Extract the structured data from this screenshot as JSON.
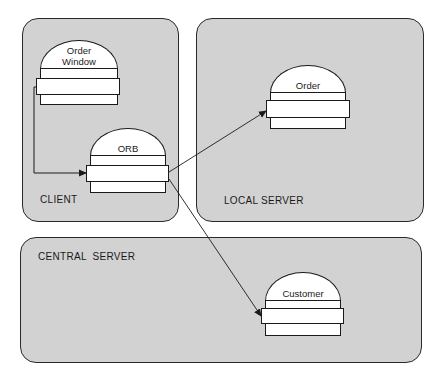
{
  "diagram": {
    "type": "distributed-object-architecture",
    "colors": {
      "background": "#ffffff",
      "panel_fill": "#d2d2d2",
      "outline": "#1a1a1a",
      "component_fill": "#ffffff"
    },
    "panels": {
      "client": {
        "label": "CLIENT"
      },
      "local_server": {
        "label": "LOCAL SERVER"
      },
      "central_server": {
        "label": "CENTRAL  SERVER"
      }
    },
    "components": {
      "order_window": {
        "label_line1": "Order",
        "label_line2": "Window",
        "panel": "client"
      },
      "orb": {
        "label": "ORB",
        "panel": "client"
      },
      "order": {
        "label": "Order",
        "panel": "local_server"
      },
      "customer": {
        "label": "Customer",
        "panel": "central_server"
      }
    },
    "connections": [
      {
        "from": "Order Window",
        "to": "ORB",
        "style": "orthogonal-arrow"
      },
      {
        "from": "ORB",
        "to": "Order",
        "style": "straight-arrow"
      },
      {
        "from": "ORB",
        "to": "Customer",
        "style": "straight-arrow"
      }
    ]
  }
}
